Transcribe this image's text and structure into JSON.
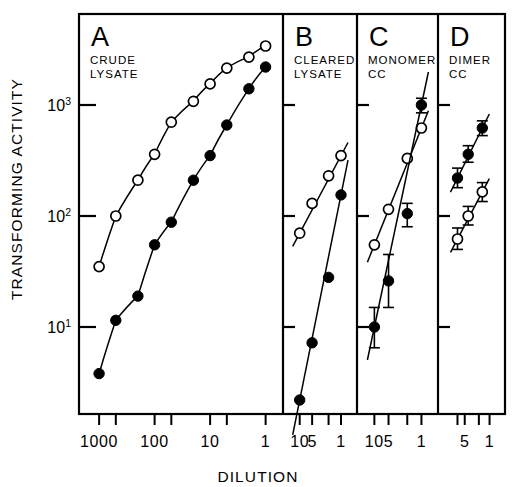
{
  "figure": {
    "y_axis_label": "TRANSFORMING ACTIVITY",
    "x_axis_label": "DILUTION"
  },
  "y_axis": {
    "ticks": [
      {
        "base": "10",
        "exp": "1",
        "value": 10
      },
      {
        "base": "10",
        "exp": "2",
        "value": 100
      },
      {
        "base": "10",
        "exp": "3",
        "value": 1000
      }
    ],
    "scale": "log",
    "range": [
      1.5,
      7000
    ]
  },
  "panels": [
    {
      "letter": "A",
      "caption_line1": "CRUDE",
      "caption_line2": "LYSATE",
      "x_tick_labels": [
        "1000",
        "100",
        "10",
        "1"
      ],
      "x_minor_ticks": [
        "500",
        "50",
        "5"
      ]
    },
    {
      "letter": "B",
      "caption_line1": "CLEARED",
      "caption_line2": "LYSATE",
      "x_tick_labels": [
        "10",
        "5",
        "1"
      ]
    },
    {
      "letter": "C",
      "caption_line1": "MONOMER",
      "caption_line2": "CC",
      "x_tick_labels": [
        "10",
        "5",
        "1"
      ]
    },
    {
      "letter": "D",
      "caption_line1": "DIMER",
      "caption_line2": "CC",
      "x_tick_labels": [
        "5",
        "1"
      ]
    }
  ],
  "chart_data": {
    "type": "scatter",
    "xlabel": "DILUTION",
    "ylabel": "TRANSFORMING ACTIVITY",
    "yscale": "log",
    "xscale": "log-reversed",
    "ylim": [
      1.5,
      7000
    ],
    "yticks": [
      10,
      100,
      1000
    ],
    "grid": false,
    "legend": "none",
    "marker_note": "open circles = one preparation, filled circles = second preparation",
    "panels": [
      {
        "letter": "A",
        "label": "CRUDE LYSATE",
        "xticks": [
          1000,
          500,
          100,
          50,
          10,
          5,
          1
        ],
        "xtick_labels": [
          "1000",
          "",
          "100",
          "",
          "10",
          "",
          "1"
        ],
        "xlim": [
          1400,
          0.8
        ],
        "series": [
          {
            "name": "open",
            "marker": "open-circle",
            "x": [
              1000,
              500,
              200,
              100,
              50,
              20,
              10,
              5,
              2,
              1
            ],
            "values": [
              35,
              100,
              210,
              360,
              700,
              1080,
              1550,
              2150,
              2700,
              3400
            ]
          },
          {
            "name": "filled",
            "marker": "filled-circle",
            "x": [
              1000,
              500,
              200,
              100,
              50,
              20,
              10,
              5,
              2,
              1
            ],
            "values": [
              3.8,
              11.5,
              19,
              55,
              88,
              210,
              350,
              660,
              1400,
              2200
            ]
          }
        ]
      },
      {
        "letter": "B",
        "label": "CLEARED LYSATE",
        "xticks": [
          10,
          5,
          1
        ],
        "xtick_labels": [
          "10",
          "5",
          "1"
        ],
        "xlim": [
          13,
          0.8
        ],
        "series": [
          {
            "name": "open",
            "marker": "open-circle",
            "x": [
              10,
              5,
              2,
              1
            ],
            "values": [
              70,
              130,
              230,
              350
            ]
          },
          {
            "name": "filled",
            "marker": "filled-circle",
            "x": [
              10,
              5,
              2,
              1
            ],
            "values": [
              2.2,
              7.2,
              28,
              155
            ]
          }
        ]
      },
      {
        "letter": "C",
        "label": "MONOMER CC",
        "xticks": [
          10,
          5,
          1
        ],
        "xtick_labels": [
          "10",
          "5",
          "1"
        ],
        "xlim": [
          13,
          0.8
        ],
        "series": [
          {
            "name": "open",
            "marker": "open-circle",
            "x": [
              10,
              5,
              2,
              1
            ],
            "values": [
              55,
              115,
              330,
              620
            ]
          },
          {
            "name": "filled",
            "marker": "filled-circle",
            "x": [
              10,
              5,
              2,
              1
            ],
            "errors_low": [
              6.5,
              15,
              80,
              850
            ],
            "errors_high": [
              15,
              45,
              130,
              1150
            ],
            "values": [
              10,
              26,
              105,
              1000
            ]
          }
        ]
      },
      {
        "letter": "D",
        "label": "DIMER CC",
        "xticks": [
          5,
          1
        ],
        "xtick_labels": [
          "5",
          "1"
        ],
        "xlim": [
          13,
          0.8
        ],
        "series": [
          {
            "name": "filled",
            "marker": "filled-circle",
            "x": [
              8,
              4,
              1.6
            ],
            "values": [
              220,
              360,
              620
            ],
            "errors_low": [
              180,
              305,
              530
            ],
            "errors_high": [
              270,
              430,
              720
            ]
          },
          {
            "name": "open",
            "marker": "open-circle",
            "x": [
              8,
              4,
              1.6
            ],
            "values": [
              62,
              100,
              165
            ],
            "errors_low": [
              50,
              83,
              135
            ],
            "errors_high": [
              78,
              122,
              200
            ]
          }
        ]
      }
    ]
  }
}
